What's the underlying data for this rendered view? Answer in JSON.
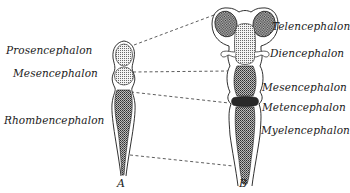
{
  "figure": {
    "left_labels": [
      {
        "id": "prosencephalon",
        "text": "Prosencephalon"
      },
      {
        "id": "mesencephalon",
        "text": "Mesencephalon"
      },
      {
        "id": "rhombencephalon",
        "text": "Rhombencephalon"
      }
    ],
    "right_labels": [
      {
        "id": "telencephalon",
        "text": "Telencephalon"
      },
      {
        "id": "diencephalon",
        "text": "Diencephalon"
      },
      {
        "id": "mesencephalon",
        "text": "Mesencephalon"
      },
      {
        "id": "metencephalon",
        "text": "Metencephalon"
      },
      {
        "id": "myelencephalon",
        "text": "Myelencephalon"
      }
    ],
    "panel_letters": {
      "a": "A",
      "b": "B"
    },
    "colors": {
      "ink": "#1a1a1a",
      "background": "#ffffff",
      "shade": "#555555"
    }
  }
}
